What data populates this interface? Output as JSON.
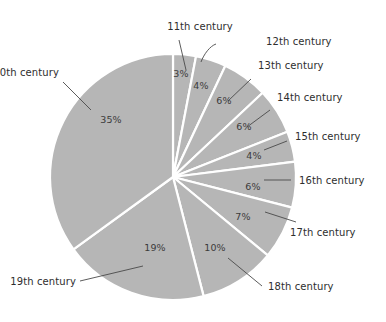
{
  "chart_data": {
    "type": "pie",
    "title": "",
    "subtitle": "",
    "xlabel": "",
    "ylabel": "",
    "legend_position": "none",
    "grid": false,
    "labels_outside": true,
    "value_unit": "%",
    "categories": [
      "11th century",
      "12th century",
      "13th century",
      "14th century",
      "15th century",
      "16th century",
      "17th century",
      "18th century",
      "19th century",
      "20th century"
    ],
    "values": [
      3,
      4,
      6,
      6,
      4,
      6,
      7,
      10,
      19,
      35
    ],
    "value_labels": [
      "3%",
      "4%",
      "6%",
      "6%",
      "4%",
      "6%",
      "7%",
      "10%",
      "19%",
      "35%"
    ],
    "start_angle_deg": 0,
    "direction": "clockwise",
    "slice_fill": "#b6b6b6",
    "slice_border": "#ffffff",
    "label_color": "#2e2e2e",
    "leader_color": "#4a4a4a",
    "background": "#ffffff"
  },
  "slices": [
    {
      "category": "11th century",
      "percent_label": "3%",
      "value": 3
    },
    {
      "category": "12th century",
      "percent_label": "4%",
      "value": 4
    },
    {
      "category": "13th century",
      "percent_label": "6%",
      "value": 6
    },
    {
      "category": "14th century",
      "percent_label": "6%",
      "value": 6
    },
    {
      "category": "15th century",
      "percent_label": "4%",
      "value": 4
    },
    {
      "category": "16th century",
      "percent_label": "6%",
      "value": 6
    },
    {
      "category": "17th century",
      "percent_label": "7%",
      "value": 7
    },
    {
      "category": "18th century",
      "percent_label": "10%",
      "value": 10
    },
    {
      "category": "19th century",
      "percent_label": "19%",
      "value": 19
    },
    {
      "category": "20th century",
      "percent_label": "35%",
      "value": 35
    }
  ]
}
